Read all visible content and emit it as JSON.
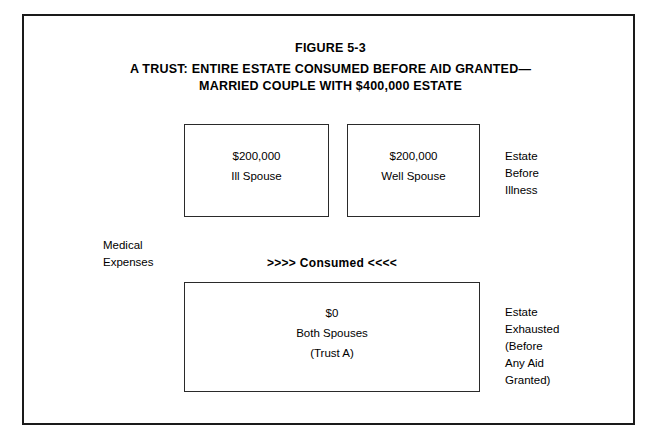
{
  "figure": {
    "title_lines": [
      "FIGURE 5-3",
      "A TRUST: ENTIRE ESTATE CONSUMED BEFORE AID GRANTED—",
      "MARRIED COUPLE WITH $400,000 ESTATE"
    ]
  },
  "boxes": {
    "ill_spouse": {
      "amount": "$200,000",
      "label": "Ill Spouse"
    },
    "well_spouse": {
      "amount": "$200,000",
      "label": "Well Spouse"
    },
    "both_spouses": {
      "amount": "$0",
      "label": "Both Spouses",
      "sublabel": "(Trust A)"
    }
  },
  "annotations": {
    "consumed_banner": ">>>> Consumed <<<<",
    "medical_expenses": {
      "line1": "Medical",
      "line2": "Expenses"
    },
    "estate_before_illness": {
      "line1": "Estate",
      "line2": "Before",
      "line3": "Illness"
    },
    "estate_exhausted": {
      "line1": "Estate",
      "line2": "Exhausted",
      "line3": "(Before",
      "line4": "Any Aid",
      "line5": "Granted)"
    }
  },
  "colors": {
    "frame": "#1a1a1a",
    "box_border": "#2a2a2a",
    "text": "#000000",
    "background": "#ffffff"
  }
}
